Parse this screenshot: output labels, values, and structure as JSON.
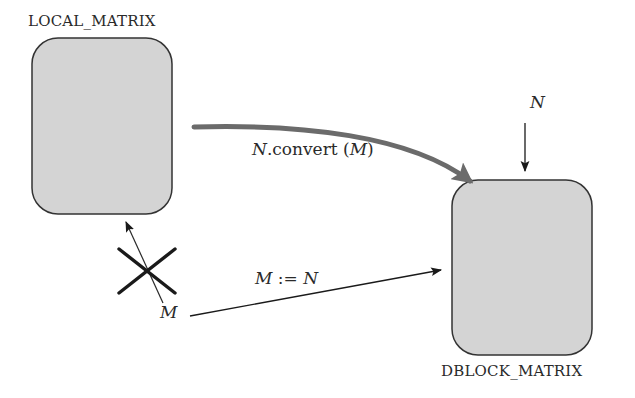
{
  "diagram": {
    "nodes": [
      {
        "id": "local",
        "label": "LOCAL_MATRIX",
        "fill": "#d4d4d4",
        "stroke": "#333333"
      },
      {
        "id": "dblock",
        "label": "DBLOCK_MATRIX",
        "fill": "#d4d4d4",
        "stroke": "#333333"
      }
    ],
    "edges": {
      "convert": {
        "from": "local",
        "to": "dblock",
        "label_var": "N",
        "label_method": ".convert (",
        "label_arg": "M",
        "label_close": ")",
        "style": "thick-gray-curved"
      },
      "input_n": {
        "to": "dblock",
        "label": "N"
      },
      "assign": {
        "from": "M",
        "to": "dblock",
        "label_lhs": "M",
        "label_op": " := ",
        "label_rhs": "N"
      },
      "forbidden": {
        "from": "M",
        "to": "local",
        "marker": "cross",
        "meaning": "not allowed"
      }
    },
    "standalone": {
      "m_label": "M"
    }
  }
}
